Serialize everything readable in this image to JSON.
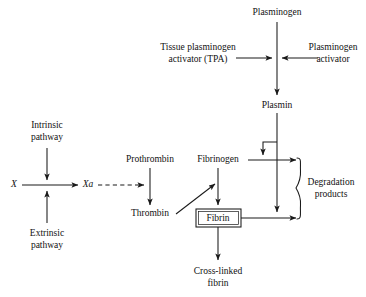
{
  "diagram": {
    "canvas": {
      "width": 366,
      "height": 297
    },
    "colors": {
      "stroke": "#1a1a1a",
      "text": "#111111",
      "background": "#ffffff"
    },
    "nodes": {
      "plasminogen": {
        "label": "Plasminogen",
        "x": 277,
        "y": 13
      },
      "tpa": {
        "label_line1": "Tissue plasminogen",
        "label_line2": "activator (TPA)",
        "x": 198,
        "y": 53
      },
      "plasminogen_activator": {
        "label_line1": "Plasminogen",
        "label_line2": "activator",
        "x": 333,
        "y": 53
      },
      "plasmin": {
        "label": "Plasmin",
        "x": 277,
        "y": 106
      },
      "intrinsic": {
        "label_line1": "Intrinsic",
        "label_line2": "pathway",
        "x": 47,
        "y": 131
      },
      "extrinsic": {
        "label_line1": "Extrinsic",
        "label_line2": "pathway",
        "x": 47,
        "y": 239
      },
      "factor_x": {
        "label": "X",
        "x": 14,
        "y": 185,
        "italic": true
      },
      "factor_xa": {
        "label": "Xa",
        "x": 88,
        "y": 185,
        "italic": true
      },
      "prothrombin": {
        "label": "Prothrombin",
        "x": 150,
        "y": 160
      },
      "thrombin": {
        "label": "Thrombin",
        "x": 150,
        "y": 214
      },
      "fibrinogen": {
        "label": "Fibrinogen",
        "x": 218,
        "y": 160
      },
      "fibrin": {
        "label": "Fibrin",
        "x": 218,
        "y": 218
      },
      "cross_linked_fibrin": {
        "label_line1": "Cross-linked",
        "label_line2": "fibrin",
        "x": 218,
        "y": 272
      },
      "degradation_products": {
        "label_line1": "Degradation",
        "label_line2": "products",
        "x": 325,
        "y": 188
      }
    },
    "edges": [
      {
        "name": "plasminogen-to-plasmin",
        "style": "solid",
        "arrow": true
      },
      {
        "name": "tpa-to-plasminogen-axis",
        "style": "solid",
        "arrow": true
      },
      {
        "name": "activator-to-plasminogen-axis",
        "style": "solid",
        "arrow": true
      },
      {
        "name": "plasmin-down-main",
        "style": "solid",
        "arrow": true
      },
      {
        "name": "plasmin-hook-to-fibrinogen-line",
        "style": "solid",
        "arrow": true
      },
      {
        "name": "intrinsic-to-x-axis",
        "style": "solid",
        "arrow": true
      },
      {
        "name": "extrinsic-to-x-axis",
        "style": "solid",
        "arrow": true
      },
      {
        "name": "x-to-xa",
        "style": "solid",
        "arrow": true
      },
      {
        "name": "xa-to-prothrombin",
        "style": "dashed",
        "arrow": true
      },
      {
        "name": "prothrombin-to-thrombin",
        "style": "solid",
        "arrow": true
      },
      {
        "name": "thrombin-to-fibrinogen-fibrin",
        "style": "solid",
        "arrow": true
      },
      {
        "name": "fibrinogen-to-fibrin",
        "style": "solid",
        "arrow": true
      },
      {
        "name": "fibrinogen-to-degradation",
        "style": "solid",
        "arrow": true
      },
      {
        "name": "fibrin-to-degradation",
        "style": "solid",
        "arrow": true
      },
      {
        "name": "fibrin-to-cross-linked",
        "style": "solid",
        "arrow": true
      }
    ],
    "brace": {
      "name": "degradation-brace",
      "x": 300,
      "y_top": 158,
      "y_bottom": 219
    },
    "box": {
      "name": "fibrin-box",
      "x": 196,
      "y": 209,
      "width": 45,
      "height": 18
    }
  }
}
